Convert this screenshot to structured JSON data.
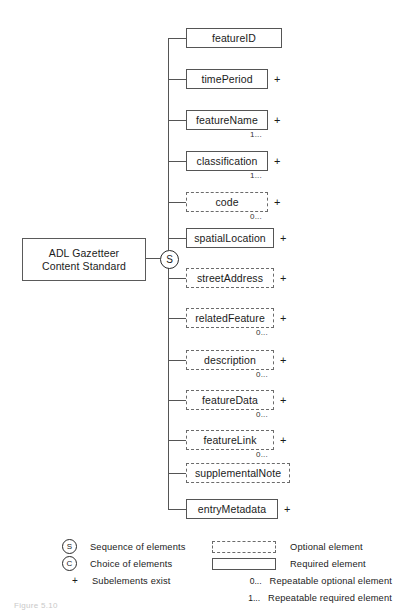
{
  "diagram": {
    "root": {
      "line1": "ADL Gazetteer",
      "line2": "Content Standard"
    },
    "junction": {
      "symbol": "S",
      "meaning": "Sequence of elements"
    },
    "nodes": [
      {
        "label": "featureID",
        "required": true,
        "plus": "",
        "repeat": "",
        "width": 96,
        "y": 28
      },
      {
        "label": "timePeriod",
        "required": true,
        "plus": "+",
        "repeat": "",
        "width": 82,
        "y": 69
      },
      {
        "label": "featureName",
        "required": true,
        "plus": "+",
        "repeat": "1...",
        "width": 82,
        "y": 110
      },
      {
        "label": "classification",
        "required": true,
        "plus": "+",
        "repeat": "1...",
        "width": 82,
        "y": 151
      },
      {
        "label": "code",
        "required": false,
        "plus": "+",
        "repeat": "0...",
        "width": 82,
        "y": 192
      },
      {
        "label": "spatialLocation",
        "required": true,
        "plus": "+",
        "repeat": "",
        "width": 88,
        "y": 228
      },
      {
        "label": "streetAddress",
        "required": false,
        "plus": "+",
        "repeat": "",
        "width": 88,
        "y": 268
      },
      {
        "label": "relatedFeature",
        "required": false,
        "plus": "+",
        "repeat": "0...",
        "width": 88,
        "y": 308
      },
      {
        "label": "description",
        "required": false,
        "plus": "+",
        "repeat": "0...",
        "width": 88,
        "y": 350
      },
      {
        "label": "featureData",
        "required": false,
        "plus": "+",
        "repeat": "0...",
        "width": 88,
        "y": 390
      },
      {
        "label": "featureLink",
        "required": false,
        "plus": "+",
        "repeat": "0...",
        "width": 88,
        "y": 430
      },
      {
        "label": "supplementalNote",
        "required": false,
        "plus": "",
        "repeat": "",
        "width": 104,
        "y": 463
      },
      {
        "label": "entryMetadata",
        "required": true,
        "plus": "+",
        "repeat": "",
        "width": 92,
        "y": 499
      }
    ]
  },
  "legend": {
    "rows": [
      {
        "symbol": "S",
        "kind": "circle",
        "label": "Sequence of elements",
        "swatch": "optional",
        "swatch_label": "Optional element",
        "card": ""
      },
      {
        "symbol": "C",
        "kind": "circle",
        "label": "Choice of elements",
        "swatch": "required",
        "swatch_label": "Required element",
        "card": ""
      },
      {
        "symbol": "+",
        "kind": "plus",
        "label": "Subelements exist",
        "swatch": "none",
        "swatch_label": "Repeatable optional element",
        "card": "0..."
      },
      {
        "symbol": "",
        "kind": "none",
        "label": "",
        "swatch": "none",
        "swatch_label": "Repeatable required element",
        "card": "1..."
      }
    ]
  },
  "caption": "Figure 5.10"
}
